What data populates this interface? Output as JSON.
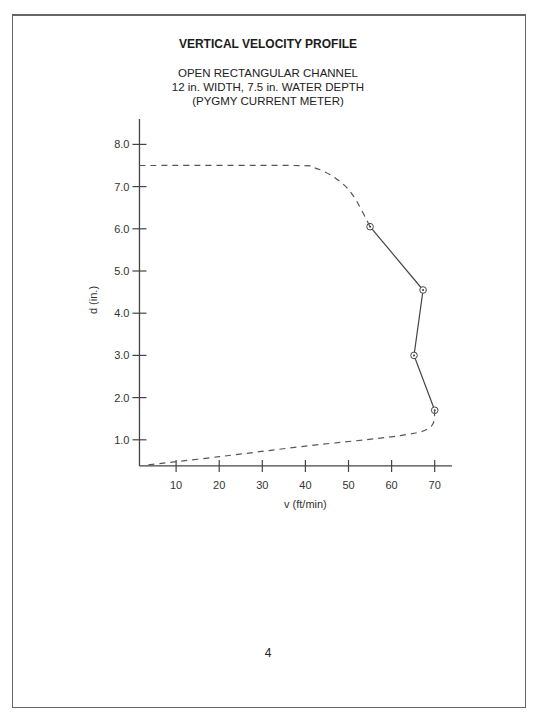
{
  "page": {
    "title": "VERTICAL VELOCITY PROFILE",
    "subtitle_lines": [
      "OPEN RECTANGULAR CHANNEL",
      "12 in. WIDTH, 7.5 in. WATER DEPTH",
      "(PYGMY CURRENT METER)"
    ],
    "page_number": "4"
  },
  "chart_data": {
    "type": "line",
    "title": "VERTICAL VELOCITY PROFILE",
    "subtitle": "OPEN RECTANGULAR CHANNEL, 12 in. WIDTH, 7.5 in. WATER DEPTH (PYGMY CURRENT METER)",
    "xlabel": "v (ft/min)",
    "ylabel": "d (in.)",
    "xlim": [
      1.5,
      74
    ],
    "ylim": [
      0.38,
      8.6
    ],
    "x_ticks": [
      10,
      20,
      30,
      40,
      50,
      60,
      70
    ],
    "x_tick_labels": [
      "10",
      "20",
      "30",
      "40",
      "50",
      "60",
      "70"
    ],
    "y_ticks": [
      1.0,
      2.0,
      3.0,
      4.0,
      5.0,
      6.0,
      7.0,
      8.0
    ],
    "y_tick_labels": [
      "1.0",
      "2.0",
      "3.0",
      "4.0",
      "5.0",
      "6.0",
      "7.0",
      "8.0"
    ],
    "grid": false,
    "legend": null,
    "series": [
      {
        "name": "measured",
        "style": "solid with circled-dot markers",
        "points": [
          {
            "v": 55.0,
            "d": 6.05
          },
          {
            "v": 67.3,
            "d": 4.55
          },
          {
            "v": 65.2,
            "d": 3.0
          },
          {
            "v": 70.0,
            "d": 1.7
          }
        ]
      },
      {
        "name": "extrapolated-top",
        "style": "dashed",
        "points": [
          {
            "v": 1.5,
            "d": 7.5
          },
          {
            "v": 37.0,
            "d": 7.5
          },
          {
            "v": 42.0,
            "d": 7.45
          },
          {
            "v": 47.0,
            "d": 7.2
          },
          {
            "v": 51.0,
            "d": 6.8
          },
          {
            "v": 55.0,
            "d": 6.05
          }
        ]
      },
      {
        "name": "extrapolated-bottom",
        "style": "dashed",
        "points": [
          {
            "v": 70.0,
            "d": 1.7
          },
          {
            "v": 69.0,
            "d": 1.3
          },
          {
            "v": 62.0,
            "d": 1.1
          },
          {
            "v": 40.0,
            "d": 0.85
          },
          {
            "v": 20.0,
            "d": 0.6
          },
          {
            "v": 3.0,
            "d": 0.4
          }
        ]
      }
    ]
  }
}
